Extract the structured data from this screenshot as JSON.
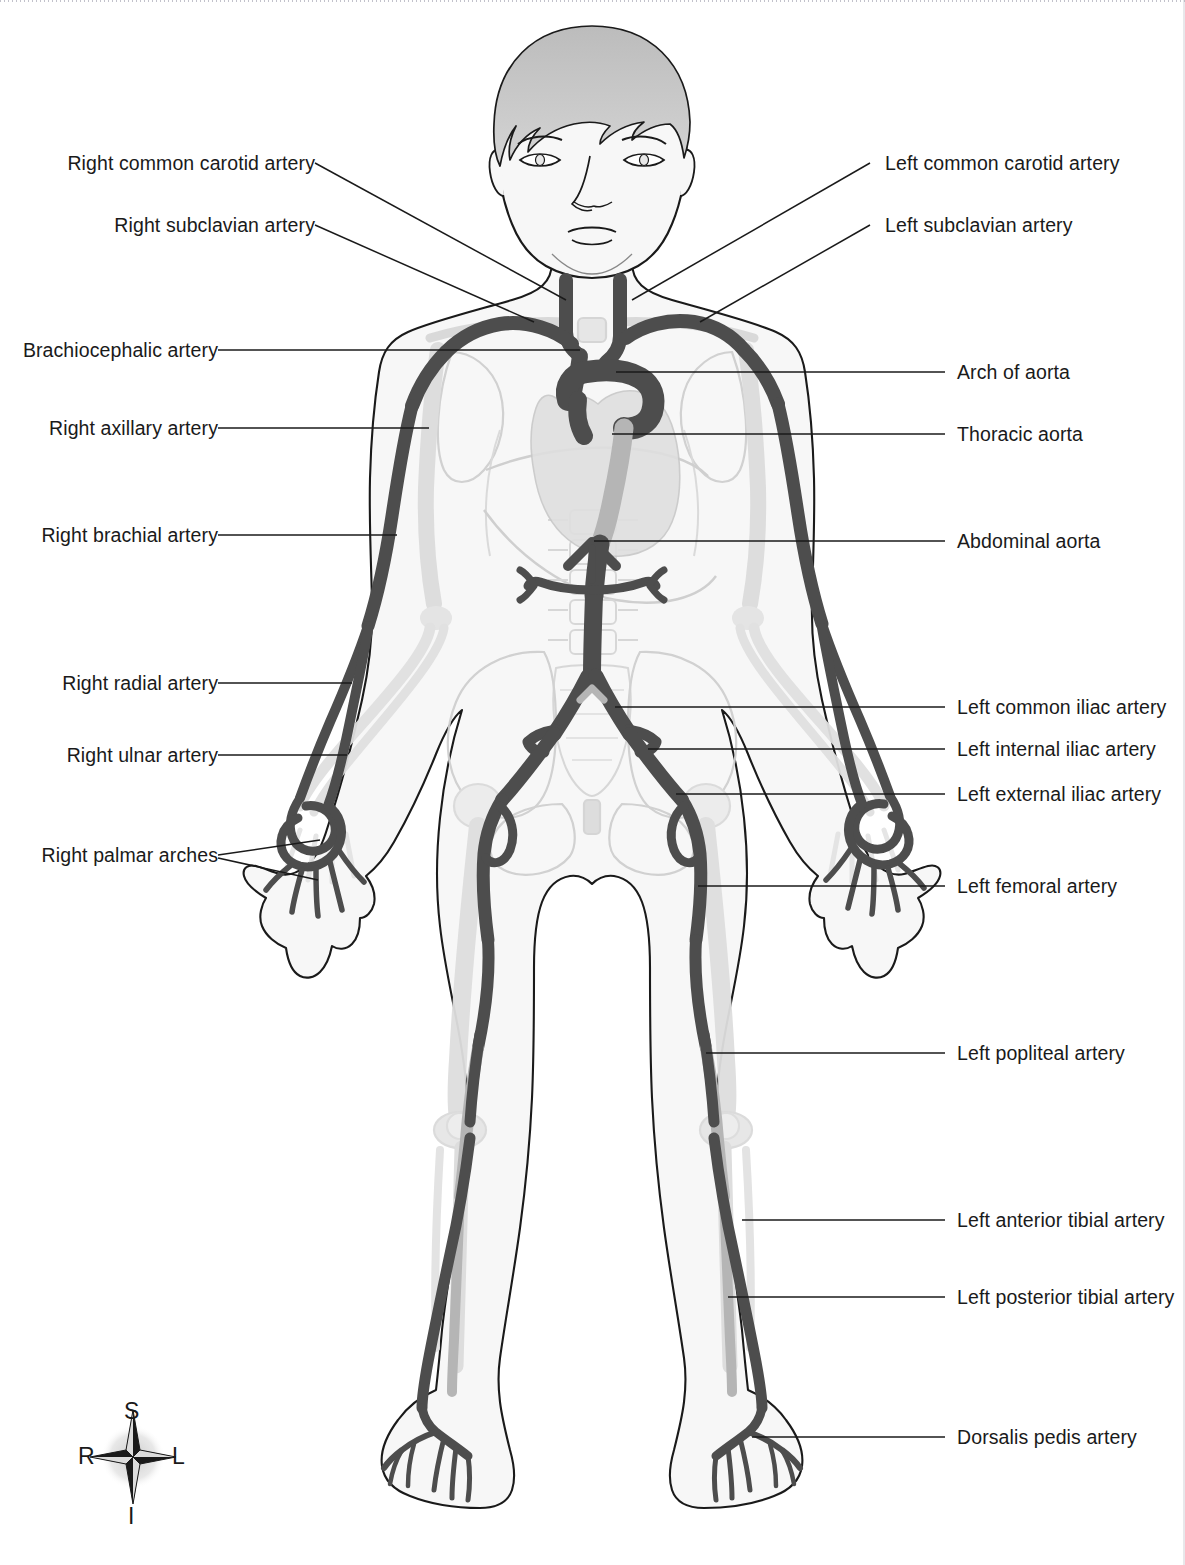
{
  "colors": {
    "artery": "#4d4d4d",
    "artery_light": "#b5b5b5",
    "skin_outline": "#1a1a1a",
    "body_fill": "#f7f7f7",
    "bone": "#e2e2e2",
    "hair": "#c9c9c9",
    "leader_line": "#1a1a1a",
    "text": "#1a1a1a"
  },
  "labels_left": [
    {
      "id": "right-common-carotid-artery",
      "text": "Right common carotid artery"
    },
    {
      "id": "right-subclavian-artery",
      "text": "Right subclavian artery"
    },
    {
      "id": "brachiocephalic-artery",
      "text": "Brachiocephalic artery"
    },
    {
      "id": "right-axillary-artery",
      "text": "Right axillary artery"
    },
    {
      "id": "right-brachial-artery",
      "text": "Right brachial artery"
    },
    {
      "id": "right-radial-artery",
      "text": "Right radial artery"
    },
    {
      "id": "right-ulnar-artery",
      "text": "Right ulnar artery"
    },
    {
      "id": "right-palmar-arches",
      "text": "Right palmar arches"
    }
  ],
  "labels_right": [
    {
      "id": "left-common-carotid-artery",
      "text": "Left common carotid artery"
    },
    {
      "id": "left-subclavian-artery",
      "text": "Left subclavian artery"
    },
    {
      "id": "arch-of-aorta",
      "text": "Arch of  aorta"
    },
    {
      "id": "thoracic-aorta",
      "text": "Thoracic aorta"
    },
    {
      "id": "abdominal-aorta",
      "text": "Abdominal aorta"
    },
    {
      "id": "left-common-iliac-artery",
      "text": "Left common iliac artery"
    },
    {
      "id": "left-internal-iliac-artery",
      "text": "Left internal iliac artery"
    },
    {
      "id": "left-external-iliac-artery",
      "text": "Left external iliac artery"
    },
    {
      "id": "left-femoral-artery",
      "text": "Left femoral artery"
    },
    {
      "id": "left-popliteal-artery",
      "text": "Left popliteal artery"
    },
    {
      "id": "left-anterior-tibial-artery",
      "text": "Left anterior tibial artery"
    },
    {
      "id": "left-posterior-tibial-artery",
      "text": "Left posterior tibial artery"
    },
    {
      "id": "dorsalis-pedis-artery",
      "text": "Dorsalis pedis artery"
    }
  ],
  "compass": {
    "superior": "S",
    "inferior": "I",
    "right": "R",
    "left": "L"
  }
}
